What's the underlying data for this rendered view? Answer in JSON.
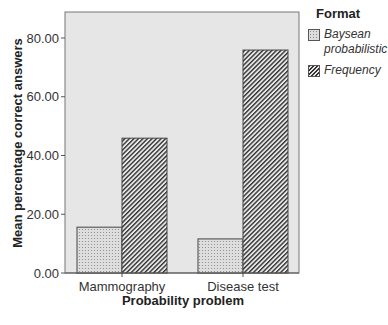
{
  "chart_data": {
    "type": "bar",
    "title": "",
    "xlabel": "Probability problem",
    "ylabel": "Mean percentage correct answers",
    "categories": [
      "Mammography",
      "Disease test"
    ],
    "series": [
      {
        "name": "Baysean probabilistic",
        "values": [
          15.6,
          11.6
        ],
        "pattern": "dots"
      },
      {
        "name": "Frequency",
        "values": [
          45.9,
          75.9
        ],
        "pattern": "hatch"
      }
    ],
    "ylim": [
      0,
      80
    ],
    "yticks": [
      "0.00",
      "20.00",
      "40.00",
      "60.00",
      "80.00"
    ],
    "grid": false,
    "legend_position": "right",
    "legend_title": "Format"
  },
  "legend": {
    "title": "Format",
    "items": [
      {
        "label_line1": "Baysean",
        "label_line2": "probabilistic"
      },
      {
        "label_line1": "Frequency"
      }
    ]
  },
  "colors": {
    "plot_bg": "#e6e6e6",
    "bar_fill": "#dcdcdc",
    "hatch": "#333333",
    "axis": "#555555"
  }
}
